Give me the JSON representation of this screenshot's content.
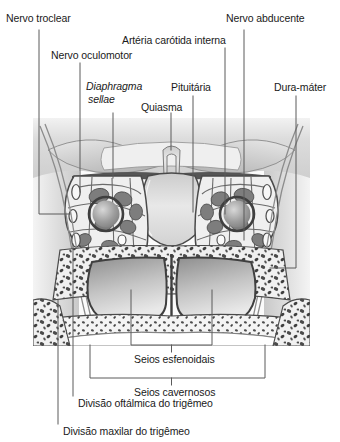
{
  "figure": {
    "type": "anatomical-illustration",
    "language": "pt-BR",
    "background_color": "#ffffff",
    "line_color": "#3c3c3c",
    "text_color": "#1a1a1a"
  },
  "labels": {
    "nervo_troclear": "Nervo troclear",
    "nervo_oculomotor": "Nervo oculomotor",
    "diaphragma_sellae_line1": "Diaphragma",
    "diaphragma_sellae_line2": "sellae",
    "arteria_carotida_interna": "Artéria carótida interna",
    "quiasma": "Quiasma",
    "pituitaria": "Pituitária",
    "nervo_abducente": "Nervo abducente",
    "dura_mater": "Dura-máter",
    "seios_esfenoidais": "Seios esfenoidais",
    "seios_cavernosos": "Seios cavernosos",
    "divisao_oftalmica": "Divisão oftálmica do trigêmeo",
    "divisao_maxilar": "Divisão maxilar do trigêmeo"
  },
  "image_region": {
    "left": 33,
    "top": 118,
    "width": 277,
    "height": 228
  }
}
